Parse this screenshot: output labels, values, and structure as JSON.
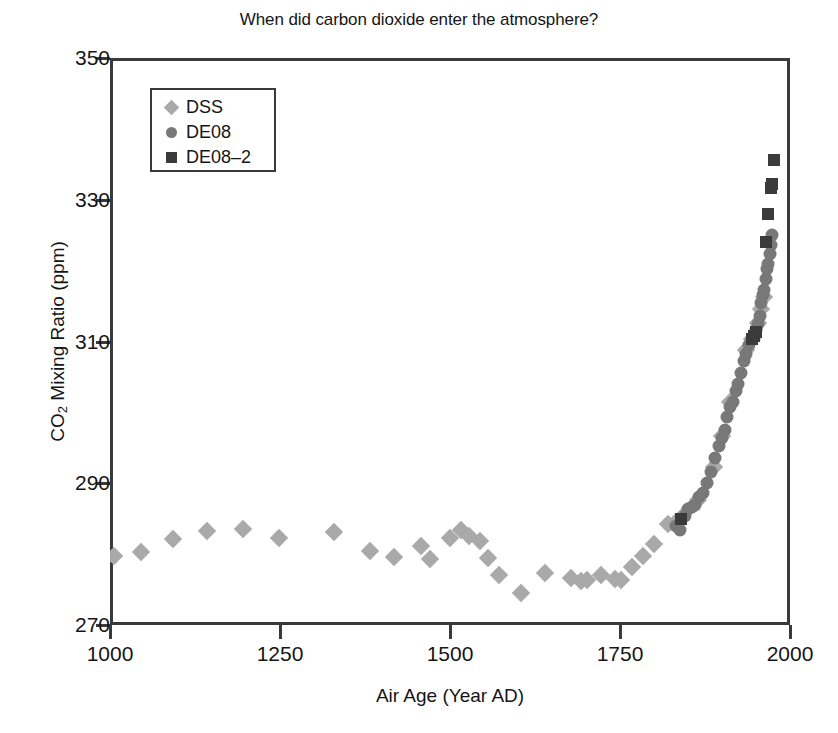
{
  "chart_data": {
    "type": "scatter",
    "title": "When did carbon dioxide enter the atmosphere?",
    "xlabel": "Air Age (Year AD)",
    "ylabel_parts": {
      "pre": "CO",
      "sub": "2",
      "post": " Mixing Ratio (ppm)"
    },
    "ylabel": "CO2 Mixing Ratio (ppm)",
    "xlim": [
      1000,
      2000
    ],
    "ylim": [
      270,
      350
    ],
    "xticks": [
      1000,
      1250,
      1500,
      1750,
      2000
    ],
    "yticks": [
      270,
      290,
      310,
      330,
      350
    ],
    "grid": false,
    "legend_position": "upper-left-inside",
    "colors": {
      "DSS": "#a9a9a9",
      "DE08": "#787878",
      "DE08-2": "#3b3b3b",
      "axis": "#3a3a3a",
      "text": "#151515",
      "background": "#ffffff"
    },
    "series": [
      {
        "name": "DSS",
        "marker": "diamond",
        "color": "#a9a9a9",
        "points": [
          [
            1006,
            279.8
          ],
          [
            1046,
            280.3
          ],
          [
            1092,
            282.2
          ],
          [
            1142,
            283.3
          ],
          [
            1196,
            283.5
          ],
          [
            1248,
            282.3
          ],
          [
            1330,
            283.1
          ],
          [
            1383,
            280.4
          ],
          [
            1418,
            279.6
          ],
          [
            1458,
            281.1
          ],
          [
            1470,
            279.3
          ],
          [
            1500,
            282.3
          ],
          [
            1516,
            283.4
          ],
          [
            1528,
            282.6
          ],
          [
            1544,
            281.8
          ],
          [
            1556,
            279.5
          ],
          [
            1572,
            277.1
          ],
          [
            1604,
            274.5
          ],
          [
            1640,
            277.4
          ],
          [
            1678,
            276.6
          ],
          [
            1692,
            276.2
          ],
          [
            1702,
            276.3
          ],
          [
            1722,
            277.1
          ],
          [
            1742,
            276.5
          ],
          [
            1752,
            276.3
          ],
          [
            1768,
            278.2
          ],
          [
            1784,
            279.7
          ],
          [
            1800,
            281.4
          ],
          [
            1820,
            284.3
          ],
          [
            1832,
            284.6
          ],
          [
            1841,
            285.2
          ],
          [
            1864,
            287.6
          ],
          [
            1888,
            292.3
          ],
          [
            1900,
            296.6
          ],
          [
            1912,
            301.5
          ],
          [
            1935,
            308.8
          ],
          [
            1944,
            310.4
          ],
          [
            1953,
            312.6
          ],
          [
            1958,
            314.6
          ],
          [
            1962,
            316.3
          ]
        ]
      },
      {
        "name": "DE08",
        "marker": "circle",
        "color": "#787878",
        "points": [
          [
            1832,
            284.0
          ],
          [
            1838,
            283.4
          ],
          [
            1845,
            285.4
          ],
          [
            1850,
            286.3
          ],
          [
            1856,
            286.6
          ],
          [
            1860,
            287.0
          ],
          [
            1866,
            288.1
          ],
          [
            1872,
            288.6
          ],
          [
            1878,
            290.0
          ],
          [
            1884,
            291.6
          ],
          [
            1890,
            293.6
          ],
          [
            1896,
            295.3
          ],
          [
            1900,
            296.4
          ],
          [
            1904,
            297.5
          ],
          [
            1908,
            299.4
          ],
          [
            1912,
            300.7
          ],
          [
            1916,
            301.5
          ],
          [
            1920,
            303.0
          ],
          [
            1924,
            304.0
          ],
          [
            1928,
            305.6
          ],
          [
            1932,
            307.3
          ],
          [
            1936,
            308.3
          ],
          [
            1940,
            309.5
          ],
          [
            1944,
            310.3
          ],
          [
            1948,
            311.0
          ],
          [
            1950,
            311.6
          ],
          [
            1953,
            312.4
          ],
          [
            1956,
            313.6
          ],
          [
            1958,
            315.4
          ],
          [
            1960,
            316.5
          ],
          [
            1962,
            317.3
          ],
          [
            1964,
            318.8
          ],
          [
            1966,
            320.2
          ],
          [
            1968,
            321.0
          ],
          [
            1970,
            322.4
          ],
          [
            1972,
            323.6
          ],
          [
            1974,
            325.0
          ]
        ]
      },
      {
        "name": "DE08-2",
        "label": "DE08–2",
        "marker": "square",
        "color": "#3b3b3b",
        "points": [
          [
            1840,
            285.0
          ],
          [
            1944,
            310.3
          ],
          [
            1947,
            310.8
          ],
          [
            1950,
            311.3
          ],
          [
            1964,
            324.0
          ],
          [
            1968,
            328.0
          ],
          [
            1972,
            331.6
          ],
          [
            1974,
            332.2
          ],
          [
            1976,
            335.6
          ]
        ]
      }
    ]
  },
  "legend": {
    "items": [
      {
        "label": "DSS",
        "marker": "diamond"
      },
      {
        "label": "DE08",
        "marker": "circle"
      },
      {
        "label": "DE08–2",
        "marker": "square"
      }
    ]
  }
}
